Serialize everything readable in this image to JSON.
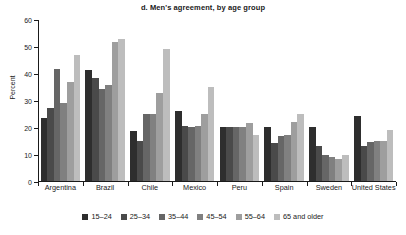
{
  "chart_data": {
    "type": "bar",
    "title": "d. Men's agreement, by age group",
    "xlabel": "",
    "ylabel": "Percent",
    "ylim": [
      0,
      60
    ],
    "yticks": [
      0,
      10,
      20,
      30,
      40,
      50,
      60
    ],
    "grid": false,
    "legend_position": "bottom",
    "categories": [
      "Argentina",
      "Brazil",
      "Chile",
      "Mexico",
      "Peru",
      "Spain",
      "Sweden",
      "United States"
    ],
    "series": [
      {
        "name": "15–24",
        "color": "#2e2e2e",
        "values": [
          23.5,
          41.0,
          18.5,
          26.0,
          20.0,
          20.0,
          20.0,
          24.0
        ]
      },
      {
        "name": "25–34",
        "color": "#4a4a4a",
        "values": [
          27.0,
          38.0,
          15.0,
          20.5,
          20.0,
          14.0,
          13.0,
          13.0
        ]
      },
      {
        "name": "35–44",
        "color": "#666666",
        "values": [
          41.5,
          34.0,
          25.0,
          20.0,
          20.0,
          16.5,
          9.5,
          14.5
        ]
      },
      {
        "name": "45–54",
        "color": "#808080",
        "values": [
          29.0,
          35.5,
          25.0,
          20.5,
          20.0,
          17.0,
          9.0,
          15.0
        ]
      },
      {
        "name": "55–64",
        "color": "#9e9e9e",
        "values": [
          36.5,
          51.5,
          32.5,
          25.0,
          21.5,
          22.0,
          8.0,
          15.0
        ]
      },
      {
        "name": "65 and older",
        "color": "#bdbdbd",
        "values": [
          46.5,
          52.5,
          49.0,
          35.0,
          17.0,
          25.0,
          9.5,
          19.0
        ]
      }
    ]
  }
}
